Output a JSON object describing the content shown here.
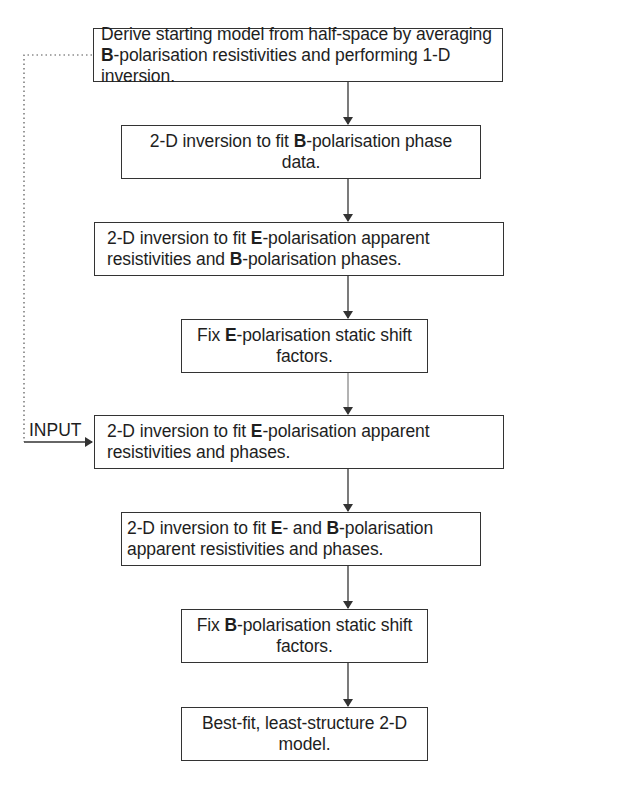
{
  "diagram": {
    "type": "flowchart",
    "steps": [
      {
        "id": "step-1",
        "segments": [
          {
            "text": "Derive starting model from half-space by averaging ",
            "bold": false
          },
          {
            "text": "B",
            "bold": true
          },
          {
            "text": "-polarisation resistivities and performing 1-D inversion.",
            "bold": false
          }
        ]
      },
      {
        "id": "step-2",
        "segments": [
          {
            "text": "2-D inversion to fit ",
            "bold": false
          },
          {
            "text": "B",
            "bold": true
          },
          {
            "text": "-polarisation phase data.",
            "bold": false
          }
        ]
      },
      {
        "id": "step-3",
        "segments": [
          {
            "text": "2-D inversion to fit ",
            "bold": false
          },
          {
            "text": "E",
            "bold": true
          },
          {
            "text": "-polarisation apparent resistivities and ",
            "bold": false
          },
          {
            "text": "B",
            "bold": true
          },
          {
            "text": "-polarisation phases.",
            "bold": false
          }
        ]
      },
      {
        "id": "step-4",
        "segments": [
          {
            "text": "Fix ",
            "bold": false
          },
          {
            "text": "E",
            "bold": true
          },
          {
            "text": "-polarisation static shift factors.",
            "bold": false
          }
        ]
      },
      {
        "id": "step-5",
        "segments": [
          {
            "text": "2-D inversion to fit ",
            "bold": false
          },
          {
            "text": "E",
            "bold": true
          },
          {
            "text": "-polarisation apparent resistivities and phases.",
            "bold": false
          }
        ]
      },
      {
        "id": "step-6",
        "segments": [
          {
            "text": "2-D inversion to fit ",
            "bold": false
          },
          {
            "text": "E",
            "bold": true
          },
          {
            "text": "- and ",
            "bold": false
          },
          {
            "text": "B",
            "bold": true
          },
          {
            "text": "-polarisation apparent resistivities and phases.",
            "bold": false
          }
        ]
      },
      {
        "id": "step-7",
        "segments": [
          {
            "text": "Fix ",
            "bold": false
          },
          {
            "text": "B",
            "bold": true
          },
          {
            "text": "-polarisation static shift factors.",
            "bold": false
          }
        ]
      },
      {
        "id": "step-8",
        "segments": [
          {
            "text": "Best-fit, least-structure 2-D model.",
            "bold": false
          }
        ]
      }
    ],
    "edges": [
      {
        "from": "step-1",
        "to": "step-2",
        "style": "solid"
      },
      {
        "from": "step-2",
        "to": "step-3",
        "style": "solid"
      },
      {
        "from": "step-3",
        "to": "step-4",
        "style": "solid"
      },
      {
        "from": "step-4",
        "to": "step-5",
        "style": "solid"
      },
      {
        "from": "step-5",
        "to": "step-6",
        "style": "solid"
      },
      {
        "from": "step-6",
        "to": "step-7",
        "style": "solid"
      },
      {
        "from": "step-7",
        "to": "step-8",
        "style": "solid"
      },
      {
        "from": "step-1",
        "to": "step-5",
        "style": "dotted",
        "label": "INPUT"
      }
    ],
    "input_label": "INPUT"
  }
}
